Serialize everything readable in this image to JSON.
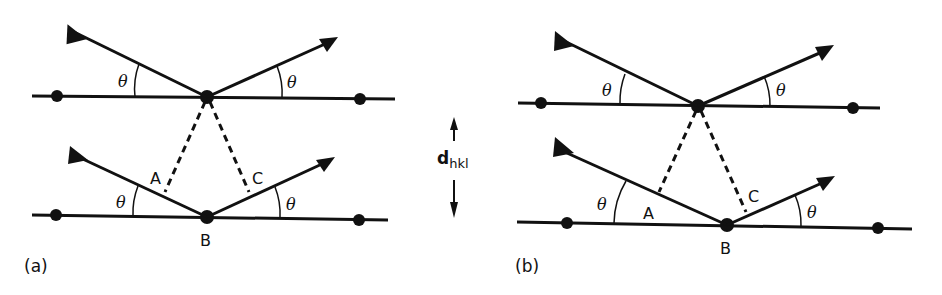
{
  "figure": {
    "spacing_label": {
      "main": "d",
      "subscript": "hkl"
    },
    "colors": {
      "ink": "#111111",
      "background": "#ffffff"
    },
    "panels": [
      {
        "id": "a",
        "panel_label": "(a)",
        "angle_label": "θ",
        "points": {
          "A": "A",
          "B": "B",
          "C": "C"
        },
        "description": "Incident and reflected rays at angle θ on two parallel planes; dashed perpendiculars from upper atom to lower rays define path difference AB + BC"
      },
      {
        "id": "b",
        "panel_label": "(b)",
        "angle_label": "θ",
        "points": {
          "A": "A",
          "B": "B",
          "C": "C"
        },
        "description": "Same construction with lower ray laterally offset"
      }
    ]
  }
}
